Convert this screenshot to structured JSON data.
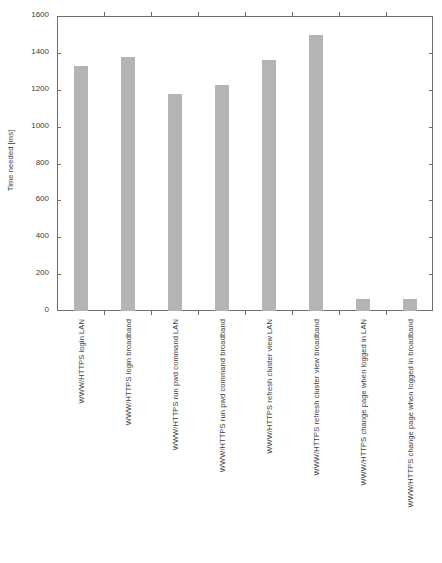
{
  "chart_data": {
    "type": "bar",
    "title": "",
    "xlabel": "",
    "ylabel": "Time needed [ms]",
    "ylim": [
      0,
      1600
    ],
    "yticks": [
      0,
      200,
      400,
      600,
      800,
      1000,
      1200,
      1400,
      1600
    ],
    "ytick_labels": [
      "0",
      "200",
      "400",
      "600",
      "800",
      "1000",
      "1200",
      "1400",
      "1600"
    ],
    "grid": false,
    "legend": null,
    "bar_color": "#b4b4b4",
    "axis_color": "#6e6e6e",
    "categories": [
      "WWW/HTTPS login LAN",
      "WWW/HTTPS login broadband",
      "WWW/HTTPS run pwd command LAN",
      "WWW/HTTPS run pwd command broadband",
      "WWW/HTTPS refresh cluster view LAN",
      "WWW/HTTPS refresh cluster view broadband",
      "WWW/HTTPS change page when logged in LAN",
      "WWW/HTTPS change page when logged in broadband"
    ],
    "values": [
      1330,
      1380,
      1175,
      1225,
      1360,
      1495,
      65,
      65
    ]
  }
}
